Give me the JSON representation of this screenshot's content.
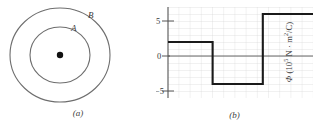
{
  "figure": {
    "panel_a": {
      "caption": "(a)",
      "outer_circle_label": "B",
      "inner_circle_label": "A",
      "center_marker": "point-charge"
    },
    "panel_b": {
      "caption": "(b)",
      "ylabel_symbol": "Φ",
      "ylabel_units_prefix": " (10",
      "ylabel_units_exp": "5",
      "ylabel_units_suffix": " N · m",
      "ylabel_units_exp2": "2",
      "ylabel_units_end": "/C)",
      "tick_labels": [
        "5",
        "0",
        "−5"
      ]
    }
  },
  "chart_data": {
    "type": "line",
    "title": "",
    "xlabel": "",
    "ylabel": "Φ (10⁵ N · m²/C)",
    "ylim": [
      -6,
      7
    ],
    "xlim": [
      0,
      13
    ],
    "yticks": [
      5,
      0,
      -5
    ],
    "grid": true,
    "legend": "none",
    "step_style": "post",
    "series": [
      {
        "name": "Electric flux",
        "segments": [
          {
            "x_start": 0,
            "x_end": 4,
            "value": 2
          },
          {
            "x_start": 4,
            "x_end": 8.5,
            "value": -4
          },
          {
            "x_start": 8.5,
            "x_end": 13,
            "value": 6
          }
        ]
      }
    ]
  }
}
